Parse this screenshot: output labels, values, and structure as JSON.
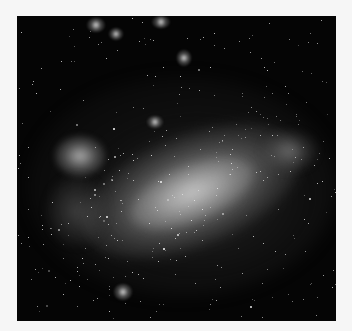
{
  "image": {
    "subject": "galaxy photograph (Large Magellanic Cloud-like), grayscale",
    "frame": {
      "x": 17,
      "y": 16,
      "width": 319,
      "height": 305
    },
    "colors": {
      "page_background": "#f6f6f6",
      "sky": "#050505",
      "nebula": "#c8c8c8",
      "star": "#ffffff"
    }
  }
}
